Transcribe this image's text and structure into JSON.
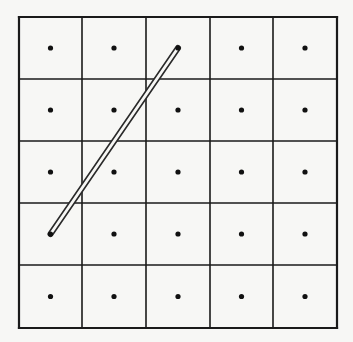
{
  "diagram": {
    "type": "grid-with-dots-and-segment",
    "grid": {
      "rows": 5,
      "cols": 5,
      "x_lines": [
        19,
        82,
        146,
        210,
        273,
        337
      ],
      "y_lines": [
        17,
        79,
        141,
        203,
        265,
        328
      ],
      "line_color": "#1a1a1a",
      "background": "#f7f7f5"
    },
    "dots": {
      "radius": 2.6,
      "color": "#111111",
      "positions_note": "one dot at the center of each of the 25 cells"
    },
    "segment": {
      "style": "double-line",
      "from": {
        "row": 0,
        "col": 2
      },
      "to": {
        "row": 3,
        "col": 0
      },
      "outer_width": 6,
      "inner_width": 2.8,
      "outer_color": "#2a2a2a",
      "inner_color": "#f7f7f5"
    }
  }
}
